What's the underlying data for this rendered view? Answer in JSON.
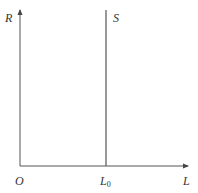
{
  "diagram": {
    "type": "supply-curve",
    "axes": {
      "y_label": "R",
      "x_label": "L",
      "origin_label": "O"
    },
    "curves": [
      {
        "name": "S",
        "label": "S",
        "kind": "vertical-line",
        "x_label": "L",
        "x_label_subscript": "0"
      }
    ],
    "colors": {
      "line": "#555555",
      "text": "#333333",
      "background": "#ffffff"
    }
  }
}
